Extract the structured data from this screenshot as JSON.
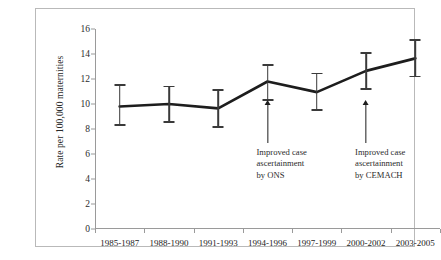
{
  "chart_data": {
    "type": "line",
    "title": "",
    "subtitle": "",
    "xlabel": "",
    "ylabel": "Rate per 100,000 maternities",
    "ylim": [
      0,
      16
    ],
    "yticks": [
      0,
      2,
      4,
      6,
      8,
      10,
      12,
      14,
      16
    ],
    "ytick_labels": [
      "0",
      "2",
      "4",
      "6",
      "8",
      "10",
      "12",
      "14",
      "16"
    ],
    "grid": false,
    "legend": "none",
    "categories": [
      "1985-1987",
      "1988-1990",
      "1991-1993",
      "1994-1996",
      "1997-1999",
      "2000-2002",
      "2003-2005"
    ],
    "series": [
      {
        "name": "Maternal mortality rate",
        "values": [
          9.8,
          10.0,
          9.65,
          11.8,
          10.95,
          12.65,
          13.65
        ],
        "error_low": [
          8.3,
          8.55,
          8.15,
          10.3,
          9.5,
          11.2,
          12.2
        ],
        "error_high": [
          11.5,
          11.4,
          11.1,
          13.1,
          12.45,
          14.1,
          15.1
        ],
        "color": "#1d1d1d"
      }
    ],
    "annotations": [
      {
        "text_lines": [
          "Improved case",
          "ascertainment",
          "by ONS"
        ],
        "points_at_category": "1994-1996",
        "arrow_direction": "up"
      },
      {
        "text_lines": [
          "Improved case",
          "ascertainment",
          "by CEMACH"
        ],
        "points_at_category": "2000-2002",
        "arrow_direction": "up"
      }
    ]
  }
}
